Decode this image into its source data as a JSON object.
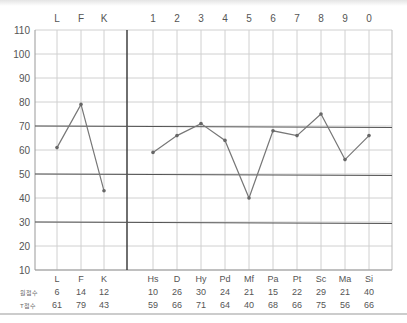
{
  "chart_data": {
    "type": "line",
    "title": "",
    "xlabel": "",
    "ylabel": "",
    "ylim": [
      10,
      110
    ],
    "yticks": [
      110,
      100,
      90,
      80,
      70,
      60,
      50,
      40,
      30,
      20,
      10
    ],
    "grid": true,
    "reference_lines": [
      70,
      50,
      30
    ],
    "validity_scales": {
      "top_labels": [
        "L",
        "F",
        "K"
      ],
      "categories": [
        "L",
        "F",
        "K"
      ],
      "raw_scores": [
        6,
        14,
        12
      ],
      "t_scores": [
        61,
        79,
        43
      ]
    },
    "clinical_scales": {
      "top_labels": [
        "1",
        "2",
        "3",
        "4",
        "5",
        "6",
        "7",
        "8",
        "9",
        "0"
      ],
      "categories": [
        "Hs",
        "D",
        "Hy",
        "Pd",
        "Mf",
        "Pa",
        "Pt",
        "Sc",
        "Ma",
        "Si"
      ],
      "raw_scores": [
        10,
        26,
        30,
        24,
        21,
        15,
        22,
        29,
        21,
        40
      ],
      "t_scores": [
        59,
        66,
        71,
        64,
        40,
        68,
        66,
        75,
        56,
        66
      ]
    },
    "series": [
      {
        "name": "T점수 (validity)",
        "x": [
          "L",
          "F",
          "K"
        ],
        "values": [
          61,
          79,
          43
        ]
      },
      {
        "name": "T점수 (clinical)",
        "x": [
          "Hs",
          "D",
          "Hy",
          "Pd",
          "Mf",
          "Pa",
          "Pt",
          "Sc",
          "Ma",
          "Si"
        ],
        "values": [
          59,
          66,
          71,
          64,
          40,
          68,
          66,
          75,
          56,
          66
        ]
      }
    ],
    "row_labels": {
      "raw": "원점수",
      "t": "T점수"
    }
  },
  "colors": {
    "line": "#777777",
    "marker": "#666666",
    "grid": "#d0d0d0",
    "ref_line": "#555555"
  }
}
